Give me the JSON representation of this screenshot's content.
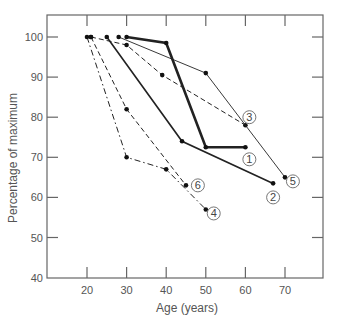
{
  "chart_data": {
    "type": "line",
    "title": "",
    "xlabel": "Age (years)",
    "ylabel": "Percentage of maximum",
    "xlim": [
      10,
      80
    ],
    "ylim": [
      40,
      105
    ],
    "x_ticks": [
      20,
      30,
      40,
      50,
      60,
      70
    ],
    "y_ticks": [
      40,
      50,
      60,
      70,
      80,
      90,
      100
    ],
    "grid": false,
    "legend": "inline circled numbers at line ends",
    "series": [
      {
        "name": "1",
        "style": "thick-solid",
        "x": [
          30,
          40,
          50,
          60
        ],
        "y": [
          100,
          98.5,
          72.5,
          72.5
        ],
        "label_pos": [
          61,
          69.5
        ]
      },
      {
        "name": "2",
        "style": "solid",
        "x": [
          25,
          44,
          67
        ],
        "y": [
          100,
          74,
          63.5
        ],
        "label_pos": [
          67,
          60
        ]
      },
      {
        "name": "3",
        "style": "dashed",
        "x": [
          21,
          30,
          39,
          60
        ],
        "y": [
          100,
          98,
          90.5,
          78
        ],
        "label_pos": [
          61,
          80
        ]
      },
      {
        "name": "4",
        "style": "dash-dot",
        "x": [
          20,
          30,
          40,
          50
        ],
        "y": [
          100,
          70,
          67,
          57
        ],
        "label_pos": [
          52,
          56
        ]
      },
      {
        "name": "5",
        "style": "thin-solid",
        "x": [
          28,
          50,
          70
        ],
        "y": [
          100,
          91,
          65
        ],
        "label_pos": [
          72,
          64
        ]
      },
      {
        "name": "6",
        "style": "dashed",
        "x": [
          21,
          30,
          45
        ],
        "y": [
          100,
          82,
          63
        ],
        "label_pos": [
          48,
          63
        ]
      }
    ]
  },
  "colors": {
    "axis": "#666666",
    "line": "#222222",
    "text": "#555555"
  }
}
